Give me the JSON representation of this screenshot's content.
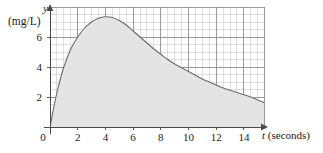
{
  "chart_data": {
    "type": "area",
    "title": "",
    "subtitle": "",
    "xlabel": "t (seconds)",
    "xlabel_variable": "t",
    "xlabel_units": "(seconds)",
    "ylabel": "y",
    "ylabel_units": "(mg/L)",
    "xlim": [
      0,
      15.5
    ],
    "ylim": [
      0,
      8
    ],
    "x_ticks": [
      0,
      2,
      4,
      6,
      8,
      10,
      12,
      14
    ],
    "x_tick_labels": [
      "0",
      "2",
      "4",
      "6",
      "8",
      "10",
      "12",
      "14"
    ],
    "y_ticks": [
      2,
      4,
      6
    ],
    "y_tick_labels": [
      "2",
      "4",
      "6"
    ],
    "grid": true,
    "grid_major_step_x": 2,
    "grid_minor_step_x": 0.5,
    "grid_major_step_y": 2,
    "grid_minor_step_y": 0.5,
    "legend": "none",
    "fill_area": true,
    "colors": {
      "curve": "#6b6b6b",
      "fill": "#e4e4e4",
      "grid_major": "#8a8a8a",
      "grid_minor": "#c9c9c9",
      "axis": "#4a4a4a",
      "text": "#1a1a1a",
      "background": "#ffffff"
    },
    "x": [
      0,
      0.25,
      0.5,
      0.75,
      1,
      1.5,
      2,
      2.5,
      3,
      3.5,
      4,
      4.5,
      5,
      5.5,
      6,
      6.5,
      7,
      7.5,
      8,
      8.5,
      9,
      9.5,
      10,
      10.5,
      11,
      11.5,
      12,
      12.5,
      13,
      13.5,
      14,
      14.5,
      15,
      15.5
    ],
    "values": [
      0,
      1.2,
      2.3,
      3.2,
      4.0,
      5.2,
      6.0,
      6.6,
      7.0,
      7.25,
      7.35,
      7.3,
      7.1,
      6.8,
      6.4,
      6.0,
      5.6,
      5.2,
      4.85,
      4.5,
      4.2,
      3.95,
      3.7,
      3.45,
      3.2,
      3.0,
      2.8,
      2.6,
      2.45,
      2.3,
      2.15,
      2.0,
      1.8,
      1.6
    ],
    "series_name": "drug concentration",
    "annotations": []
  },
  "axes": {
    "y_variable": "y",
    "y_units": "(mg/L)",
    "x_name": "t (seconds)",
    "x_variable": "t",
    "x_units": "(seconds)"
  }
}
